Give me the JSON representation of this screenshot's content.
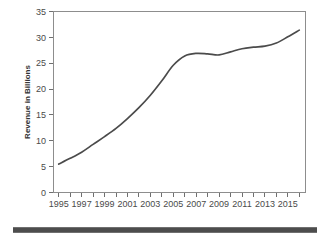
{
  "chart_data": {
    "type": "line",
    "title": "",
    "subtitle": "",
    "xlabel": "",
    "ylabel": "Revenue in Billions",
    "xlim": [
      1994.5,
      2016.5
    ],
    "ylim": [
      0,
      35
    ],
    "yticks": [
      0,
      5,
      10,
      15,
      20,
      25,
      30,
      35
    ],
    "ytick_labels": [
      "0",
      "5",
      "10",
      "15",
      "20",
      "25",
      "30",
      "35"
    ],
    "xticks": [
      1995,
      1996,
      1997,
      1998,
      1999,
      2000,
      2001,
      2002,
      2003,
      2004,
      2005,
      2006,
      2007,
      2008,
      2009,
      2010,
      2011,
      2012,
      2013,
      2014,
      2015,
      2016
    ],
    "xtick_labels": [
      "1995",
      "",
      "1997",
      "",
      "1999",
      "",
      "2001",
      "",
      "2003",
      "",
      "2005",
      "",
      "2007",
      "",
      "2009",
      "",
      "2011",
      "",
      "2013",
      "",
      "2015",
      ""
    ],
    "x": [
      1995,
      1996,
      1997,
      1998,
      1999,
      2000,
      2001,
      2002,
      2003,
      2004,
      2005,
      2006,
      2007,
      2008,
      2009,
      2010,
      2011,
      2012,
      2013,
      2014,
      2015,
      2016
    ],
    "values": [
      5.5,
      6.6,
      7.8,
      9.3,
      10.8,
      12.4,
      14.3,
      16.4,
      18.8,
      21.6,
      24.6,
      26.4,
      26.9,
      26.8,
      26.6,
      27.2,
      27.8,
      28.1,
      28.3,
      28.9,
      30.1,
      31.4
    ],
    "series": [
      {
        "name": "Revenue",
        "values": [
          5.5,
          6.6,
          7.8,
          9.3,
          10.8,
          12.4,
          14.3,
          16.4,
          18.8,
          21.6,
          24.6,
          26.4,
          26.9,
          26.8,
          26.6,
          27.2,
          27.8,
          28.1,
          28.3,
          28.9,
          30.1,
          31.4
        ],
        "color": "#4b4b4b"
      }
    ],
    "grid": false,
    "legend": "none",
    "line_color": "#4b4b4b",
    "frame_color": "#8d8d8d",
    "background": "#ffffff"
  },
  "footer": {
    "bar_color": "#4d4d4d"
  }
}
